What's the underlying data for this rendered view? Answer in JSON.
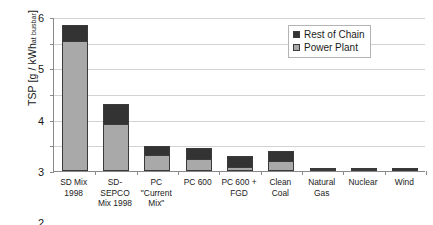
{
  "chart_data": {
    "type": "bar",
    "stacked": true,
    "title": "",
    "xlabel": "",
    "ylabel": "TSP [g / kWh at busbar]",
    "ylabel_main": "TSP [g / kWh",
    "ylabel_sub": "at busbar",
    "ylabel_close": "]",
    "ylim": [
      0,
      6
    ],
    "yticks": [
      0,
      1,
      2,
      3,
      4,
      5,
      6
    ],
    "ytick_labels": [
      "0",
      "1",
      "2",
      "3",
      "4",
      "5",
      "6"
    ],
    "grid": true,
    "legend_position": "top-right",
    "categories": [
      "SD Mix 1998",
      "SD-SEPCO Mix 1998",
      "PC \"Current Mix\"",
      "PC 600",
      "PC 600 + FGD",
      "Clean Coal",
      "Natural Gas",
      "Nuclear",
      "Wind"
    ],
    "category_lines": [
      [
        "SD Mix",
        "1998"
      ],
      [
        "SD-",
        "SEPCO",
        "Mix 1998"
      ],
      [
        "PC",
        "\"Current",
        "Mix\""
      ],
      [
        "PC 600"
      ],
      [
        "PC 600 +",
        "FGD"
      ],
      [
        "Clean",
        "Coal"
      ],
      [
        "Natural",
        "Gas"
      ],
      [
        "Nuclear"
      ],
      [
        "Wind"
      ]
    ],
    "series": [
      {
        "name": "Power Plant",
        "color": "#a9a9a9",
        "values": [
          5.05,
          1.85,
          0.62,
          0.47,
          0.16,
          0.4,
          0.01,
          0.01,
          0.0
        ]
      },
      {
        "name": "Rest of Chain",
        "color": "#333333",
        "values": [
          0.65,
          0.75,
          0.35,
          0.43,
          0.42,
          0.38,
          0.01,
          0.02,
          0.13
        ]
      }
    ],
    "totals": [
      5.7,
      2.6,
      0.97,
      0.9,
      0.58,
      0.78,
      0.02,
      0.03,
      0.13
    ]
  },
  "legend": {
    "items": [
      {
        "label": "Rest of Chain",
        "color": "#333333"
      },
      {
        "label": "Power Plant",
        "color": "#a9a9a9"
      }
    ]
  },
  "colors": {
    "rest_of_chain": "#333333",
    "power_plant": "#a9a9a9",
    "axis": "#8a8a8a",
    "grid": "#d2d2d2",
    "bar_outline": "#3a3a3a",
    "background": "#ffffff"
  }
}
